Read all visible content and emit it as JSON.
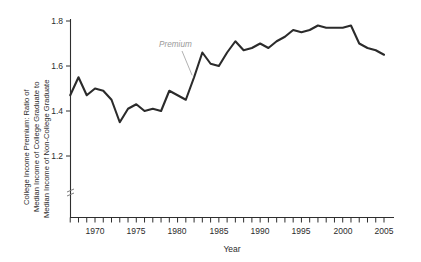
{
  "chart_data": {
    "type": "line",
    "title": "",
    "xlabel": "Year",
    "ylabel": "College Income Premium: Ratio of Median Income of College Graduate to Median Income of Non-College Graduate",
    "ylabel_lines": [
      "College Income Premium: Ratio of",
      "Median Income of College Graduate to",
      "Median Income of Non-College Graduate"
    ],
    "xlim": [
      1966.4,
      2005.9
    ],
    "ylim": [
      1.1,
      1.82
    ],
    "y_axis_break": true,
    "grid": false,
    "legend": "none",
    "xticks": [
      1967,
      1968,
      1969,
      1970,
      1971,
      1972,
      1973,
      1974,
      1975,
      1976,
      1977,
      1978,
      1979,
      1980,
      1981,
      1982,
      1983,
      1984,
      1985,
      1986,
      1987,
      1988,
      1989,
      1990,
      1991,
      1992,
      1993,
      1994,
      1995,
      1996,
      1997,
      1998,
      1999,
      2000,
      2001,
      2002,
      2003,
      2004,
      2005
    ],
    "xtick_labels": [
      "1970",
      "1975",
      "1980",
      "1985",
      "1990",
      "1995",
      "2000",
      "2005"
    ],
    "xtick_label_values": [
      1970,
      1975,
      1980,
      1985,
      1990,
      1995,
      2000,
      2005
    ],
    "yticks": [
      1.2,
      1.4,
      1.6,
      1.8
    ],
    "ytick_labels": [
      "1.2",
      "1.4",
      "1.6",
      "1.8"
    ],
    "annotations": [
      {
        "text": "Premium",
        "color": "#9a9a9a",
        "style": "italic",
        "points_to_year": 1982
      }
    ],
    "series": [
      {
        "name": "Premium",
        "color": "#2b2b2b",
        "x": [
          1967,
          1968,
          1969,
          1970,
          1971,
          1972,
          1973,
          1974,
          1975,
          1976,
          1977,
          1978,
          1979,
          1980,
          1981,
          1982,
          1983,
          1984,
          1985,
          1986,
          1987,
          1988,
          1989,
          1990,
          1991,
          1992,
          1993,
          1994,
          1995,
          1996,
          1997,
          1998,
          1999,
          2000,
          2001,
          2002,
          2003,
          2004,
          2005
        ],
        "values": [
          1.47,
          1.55,
          1.47,
          1.5,
          1.49,
          1.45,
          1.35,
          1.41,
          1.43,
          1.4,
          1.41,
          1.4,
          1.49,
          1.47,
          1.45,
          1.55,
          1.66,
          1.61,
          1.6,
          1.66,
          1.71,
          1.67,
          1.68,
          1.7,
          1.68,
          1.71,
          1.73,
          1.76,
          1.75,
          1.76,
          1.78,
          1.77,
          1.77,
          1.77,
          1.78,
          1.7,
          1.68,
          1.67,
          1.65
        ]
      }
    ]
  },
  "axis": {
    "x_title": "Year",
    "y_line_1": "College Income Premium: Ratio of",
    "y_line_2": "Median Income of College Graduate to",
    "y_line_3": "Median Income of Non-College Graduate"
  },
  "annotation": {
    "premium_label": "Premium"
  },
  "ytick": {
    "t0": "1.2",
    "t1": "1.4",
    "t2": "1.6",
    "t3": "1.8"
  },
  "xtick": {
    "t0": "1970",
    "t1": "1975",
    "t2": "1980",
    "t3": "1985",
    "t4": "1990",
    "t5": "1995",
    "t6": "2000",
    "t7": "2005"
  }
}
